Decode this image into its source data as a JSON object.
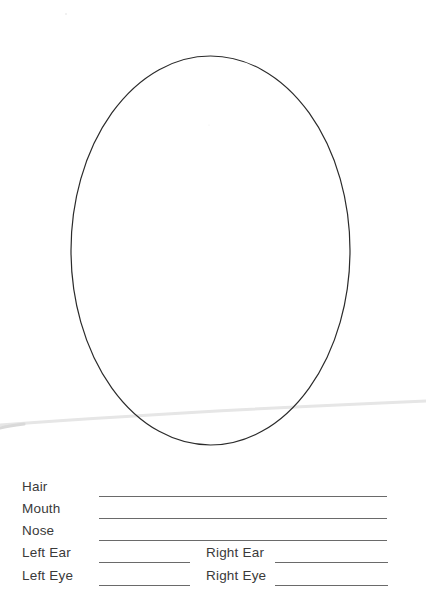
{
  "worksheet": {
    "face_outline": {
      "shape": "oval",
      "stroke_color": "#2b2b2b"
    },
    "form": {
      "fields": [
        {
          "key": "hair",
          "label": "Hair",
          "value": ""
        },
        {
          "key": "mouth",
          "label": "Mouth",
          "value": ""
        },
        {
          "key": "nose",
          "label": "Nose",
          "value": ""
        },
        {
          "key": "left_ear",
          "label": "Left Ear",
          "value": ""
        },
        {
          "key": "right_ear",
          "label": "Right Ear",
          "value": ""
        },
        {
          "key": "left_eye",
          "label": "Left Eye",
          "value": ""
        },
        {
          "key": "right_eye",
          "label": "Right Eye",
          "value": ""
        }
      ]
    }
  }
}
